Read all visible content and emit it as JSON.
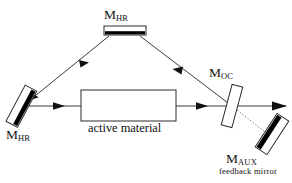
{
  "figure": {
    "type": "optical-cavity-diagram",
    "background_color": "#ffffff",
    "line_color": "#3a3a3a",
    "mirror_coating_color": "#000000"
  },
  "labels": {
    "mhr_top": {
      "main": "M",
      "sub": "HR"
    },
    "mhr_left": {
      "main": "M",
      "sub": "HR"
    },
    "moc": {
      "main": "M",
      "sub": "OC"
    },
    "maux": {
      "main": "M",
      "sub": "AUX"
    },
    "feedback_caption": "feedback mirror",
    "active_material": "active material"
  },
  "components": [
    {
      "name": "high-reflector-top",
      "label": "M_HR",
      "shape": "horizontal-bar",
      "coating": "bottom-face"
    },
    {
      "name": "high-reflector-left",
      "label": "M_HR",
      "shape": "tilted-bar",
      "coating": "inner-face"
    },
    {
      "name": "active-material",
      "label": "active material",
      "shape": "rectangle",
      "fill": "none"
    },
    {
      "name": "output-coupler",
      "label": "M_OC",
      "shape": "tilted-bar",
      "fill": "none"
    },
    {
      "name": "auxiliary-mirror",
      "label": "M_AUX",
      "shape": "tilted-bar",
      "coating": "upper-face"
    }
  ],
  "beams": [
    {
      "name": "left-mirror-to-active-material",
      "direction": "right",
      "style": "solid",
      "arrow": true
    },
    {
      "name": "active-material-to-output-coupler",
      "direction": "right",
      "style": "solid",
      "arrow": true
    },
    {
      "name": "output-coupler-to-top-mirror",
      "direction": "up-left",
      "style": "solid",
      "arrow": true
    },
    {
      "name": "top-mirror-to-left-mirror",
      "direction": "down-left",
      "style": "solid",
      "arrow": true
    },
    {
      "name": "output-beam",
      "direction": "right",
      "style": "solid",
      "arrow": true
    },
    {
      "name": "feedback-path",
      "direction": "down-right",
      "style": "dotted",
      "arrow": false
    }
  ]
}
